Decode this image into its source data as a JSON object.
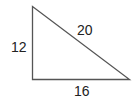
{
  "diagram": {
    "type": "right-triangle",
    "sides": {
      "vertical": "12",
      "hypotenuse": "20",
      "horizontal": "16"
    },
    "stroke_color": "#555555"
  }
}
